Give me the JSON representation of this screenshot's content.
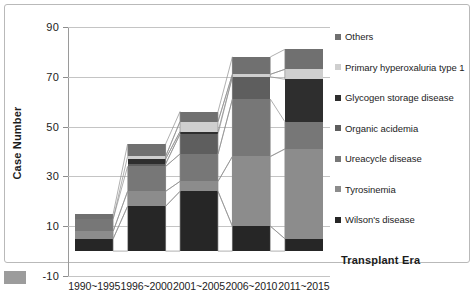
{
  "chart_data": {
    "type": "bar",
    "subtype": "stacked-column",
    "title": "",
    "xlabel": "Transplant Era",
    "ylabel": "Case Number",
    "ylim": [
      -10,
      90
    ],
    "yticks": [
      -10,
      10,
      30,
      50,
      70,
      90
    ],
    "grid": true,
    "legend_position": "right",
    "categories": [
      "1990~1995",
      "1996~2000",
      "2001~2005",
      "2006~2010",
      "2011~2015"
    ],
    "series": [
      {
        "name": "Wilson's disease",
        "color": "#262626",
        "values": [
          5,
          18,
          24,
          10,
          5
        ]
      },
      {
        "name": "Tyrosinemia",
        "color": "#8c8c8c",
        "values": [
          3,
          6,
          4,
          28,
          36
        ]
      },
      {
        "name": "Ureacycle disease",
        "color": "#777777",
        "values": [
          5,
          10,
          11,
          23,
          11
        ]
      },
      {
        "name": "Organic acidemia",
        "color": "#5e5e5e",
        "values": [
          0,
          1,
          8,
          9,
          0
        ]
      },
      {
        "name": "Glycogen storage disease",
        "color": "#2e2e2e",
        "values": [
          0,
          2,
          1,
          0,
          17
        ]
      },
      {
        "name": "Primary hyperoxaluria type 1",
        "color": "#cfcfcf",
        "values": [
          0,
          1,
          4,
          1,
          4
        ]
      },
      {
        "name": "Others",
        "color": "#707070",
        "values": [
          2,
          5,
          4,
          7,
          8
        ]
      }
    ],
    "totals": [
      15,
      43,
      56,
      78,
      81
    ]
  },
  "legend": {
    "items": [
      {
        "label": "Others",
        "color": "#707070"
      },
      {
        "label": "Primary hyperoxaluria type 1",
        "color": "#cfcfcf"
      },
      {
        "label": "Glycogen storage disease",
        "color": "#2e2e2e"
      },
      {
        "label": "Organic acidemia",
        "color": "#5e5e5e"
      },
      {
        "label": "Ureacycle disease",
        "color": "#777777"
      },
      {
        "label": "Tyrosinemia",
        "color": "#8c8c8c"
      },
      {
        "label": "Wilson's disease",
        "color": "#262626"
      }
    ]
  },
  "caption": {
    "text": ""
  }
}
